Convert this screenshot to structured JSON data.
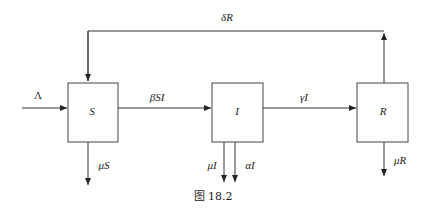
{
  "diagram": {
    "type": "compartment-flow",
    "nodes": [
      {
        "id": "S",
        "label": "S"
      },
      {
        "id": "I",
        "label": "I"
      },
      {
        "id": "R",
        "label": "R"
      }
    ],
    "edges": {
      "inflow": {
        "label": "Λ",
        "to": "S"
      },
      "s_to_i": {
        "label": "βSI",
        "from": "S",
        "to": "I"
      },
      "i_to_r": {
        "label": "γI",
        "from": "I",
        "to": "R"
      },
      "r_to_s": {
        "label": "δR",
        "from": "R",
        "to": "S"
      },
      "s_out": {
        "label": "μS",
        "from": "S"
      },
      "i_out_mu": {
        "label": "μI",
        "from": "I"
      },
      "i_out_alpha": {
        "label": "αI",
        "from": "I"
      },
      "r_out": {
        "label": "μR",
        "from": "R"
      }
    },
    "caption": "图 18.2"
  }
}
